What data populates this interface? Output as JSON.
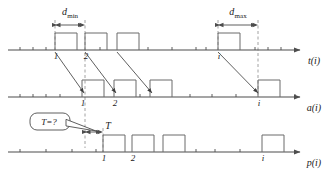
{
  "figure": {
    "type": "timing-diagram"
  },
  "axes": [
    {
      "id": "t",
      "label": "t(i)",
      "baseline_y": 50,
      "x_start": 8,
      "x_end": 300,
      "pulses": [
        {
          "index_label": "1",
          "x": 55,
          "w": 22
        },
        {
          "index_label": "2",
          "x": 85,
          "w": 22
        },
        {
          "index_label": "",
          "x": 117,
          "w": 22
        },
        {
          "index_label": "i",
          "x": 218,
          "w": 22
        }
      ],
      "ticks": [
        20,
        33,
        46,
        100,
        148,
        172,
        196,
        206,
        255,
        268,
        281
      ]
    },
    {
      "id": "a",
      "label": "a(i)",
      "baseline_y": 97,
      "x_start": 8,
      "x_end": 300,
      "pulses": [
        {
          "index_label": "1",
          "x": 82,
          "w": 22
        },
        {
          "index_label": "2",
          "x": 114,
          "w": 22
        },
        {
          "index_label": "",
          "x": 150,
          "w": 22
        },
        {
          "index_label": "i",
          "x": 258,
          "w": 22
        }
      ],
      "ticks": [
        20,
        33,
        46,
        60,
        140,
        190,
        212,
        236,
        295
      ]
    },
    {
      "id": "p",
      "label": "p(i)",
      "baseline_y": 152,
      "x_start": 8,
      "x_end": 300,
      "pulses": [
        {
          "index_label": "1",
          "x": 103,
          "w": 22
        },
        {
          "index_label": "2",
          "x": 132,
          "w": 22
        },
        {
          "index_label": "",
          "x": 163,
          "w": 22
        },
        {
          "index_label": "i",
          "x": 262,
          "w": 22
        }
      ],
      "ticks": [
        20,
        46,
        72,
        96,
        196,
        215,
        240
      ]
    }
  ],
  "dimensions": [
    {
      "name": "d_min",
      "base": "d",
      "sub": "min",
      "x1": 55,
      "x2": 85,
      "y": 25,
      "label_x": 70,
      "label_y": 15
    },
    {
      "name": "d_max",
      "base": "d",
      "sub": "max",
      "x1": 218,
      "x2": 258,
      "y": 25,
      "label_x": 238,
      "label_y": 15
    },
    {
      "name": "T",
      "base": "T",
      "sub": "",
      "x1": 85,
      "x2": 103,
      "y": 132,
      "label_x": 108,
      "label_y": 129
    }
  ],
  "dashed_guides": [
    {
      "x": 55,
      "y1": 20,
      "y2": 50
    },
    {
      "x": 85,
      "y1": 20,
      "y2": 148
    },
    {
      "x": 218,
      "y1": 20,
      "y2": 50
    },
    {
      "x": 258,
      "y1": 20,
      "y2": 97
    },
    {
      "x": 103,
      "y1": 128,
      "y2": 152
    }
  ],
  "mapping_arrows": [
    {
      "from_x": 55,
      "from_y": 52,
      "to_x": 84,
      "to_y": 93
    },
    {
      "from_x": 85,
      "from_y": 52,
      "to_x": 116,
      "to_y": 93
    },
    {
      "from_x": 117,
      "from_y": 52,
      "to_x": 152,
      "to_y": 93
    },
    {
      "from_x": 218,
      "from_y": 52,
      "to_x": 258,
      "to_y": 93
    }
  ],
  "callout": {
    "text": "T=?",
    "x": 30,
    "y": 113,
    "w": 40,
    "h": 17,
    "tail_to_x": 96,
    "tail_to_y": 131
  },
  "colors": {
    "line": "#4d4d4d",
    "pulse": "#6a6a6a",
    "dashed": "#8a8a8a",
    "text": "#1a1a1a"
  }
}
